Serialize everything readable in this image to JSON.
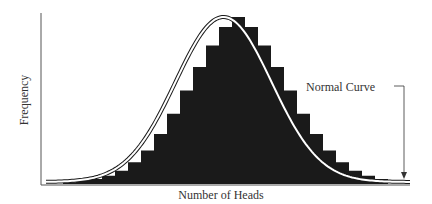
{
  "chart_data": {
    "type": "bar",
    "title": "",
    "xlabel": "Number of Heads",
    "ylabel": "Frequency",
    "annotations": [
      {
        "text": "Normal Curve",
        "points_to": "right tail of normal curve"
      }
    ],
    "grid": false,
    "legend": null,
    "bar_color": "#1a1a1a",
    "curve_color": "#ffffff",
    "curve_outline_color": "#1a1a1a",
    "categories": [
      1,
      2,
      3,
      4,
      5,
      6,
      7,
      8,
      9,
      10,
      11,
      12,
      13,
      14,
      15,
      16,
      17,
      18,
      19,
      20,
      21,
      22,
      23,
      24,
      25
    ],
    "values": [
      1,
      2,
      3,
      5,
      8,
      13,
      20,
      30,
      42,
      56,
      70,
      83,
      94,
      100,
      94,
      83,
      70,
      56,
      42,
      30,
      20,
      13,
      8,
      5,
      3
    ],
    "series": [
      {
        "name": "Histogram (observed frequency)",
        "values": [
          1,
          2,
          3,
          5,
          8,
          13,
          20,
          30,
          42,
          56,
          70,
          83,
          94,
          100,
          94,
          83,
          70,
          56,
          42,
          30,
          20,
          13,
          8,
          5,
          3
        ]
      },
      {
        "name": "Normal Curve",
        "type": "line",
        "values": [
          1,
          2,
          3,
          4,
          7,
          11,
          18,
          27,
          39,
          53,
          67,
          80,
          91,
          97,
          97,
          91,
          80,
          67,
          53,
          39,
          27,
          18,
          11,
          7,
          4
        ]
      }
    ],
    "ylim": [
      0,
      105
    ]
  },
  "labels": {
    "ylabel": "Frequency",
    "xlabel": "Number of Heads",
    "annotation": "Normal Curve"
  }
}
